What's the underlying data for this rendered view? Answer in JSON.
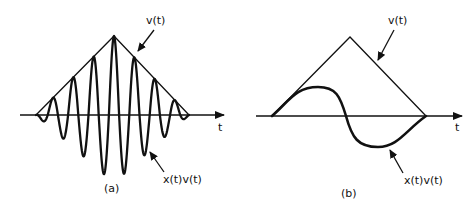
{
  "colors": {
    "ink": "#111111",
    "background": "#ffffff"
  },
  "panels": [
    {
      "id": "a",
      "caption": "(a)",
      "axis_label": "t",
      "envelope_label": "v(t)",
      "product_label": "x(t)v(t)",
      "axis": {
        "y": 115,
        "x_start": 20,
        "x_end": 224
      },
      "envelope": {
        "left": [
          36,
          115
        ],
        "apex": [
          114,
          36
        ],
        "right": [
          189,
          115
        ]
      },
      "product_curve": {
        "description": "high-frequency oscillation modulated by triangular envelope v(t)",
        "peaks": [
          [
            52,
            98
          ],
          [
            69,
            80
          ],
          [
            89,
            61
          ],
          [
            114,
            36
          ],
          [
            136,
            61
          ],
          [
            155,
            80
          ],
          [
            172,
            98
          ]
        ],
        "troughs": [
          [
            44,
            124
          ],
          [
            62,
            143
          ],
          [
            80,
            160
          ],
          [
            101,
            183
          ],
          [
            126,
            183
          ],
          [
            146,
            160
          ],
          [
            163,
            143
          ],
          [
            181,
            124
          ]
        ]
      },
      "label_positions": {
        "envelope_label": [
          146,
          24
        ],
        "envelope_arrow": [
          [
            154,
            30
          ],
          [
            138,
            51
          ]
        ],
        "product_label": [
          163,
          183
        ],
        "product_arrow": [
          [
            164,
            172
          ],
          [
            150,
            152
          ]
        ],
        "axis_label": [
          218,
          131
        ],
        "caption": [
          104,
          192
        ]
      }
    },
    {
      "id": "b",
      "caption": "(b)",
      "axis_label": "t",
      "envelope_label": "v(t)",
      "product_label": "x(t)v(t)",
      "axis": {
        "y": 116,
        "x_start": 256,
        "x_end": 462
      },
      "envelope": {
        "left": [
          272,
          116
        ],
        "apex": [
          350,
          37
        ],
        "right": [
          426,
          116
        ]
      },
      "product_curve": {
        "description": "slowly varying signal multiplied by triangular envelope v(t)",
        "points": [
          [
            272,
            116
          ],
          [
            318,
            87
          ],
          [
            346,
            116
          ],
          [
            378,
            147
          ],
          [
            426,
            116
          ]
        ]
      },
      "label_positions": {
        "envelope_label": [
          388,
          24
        ],
        "envelope_arrow": [
          [
            394,
            30
          ],
          [
            378,
            60
          ]
        ],
        "product_label": [
          404,
          184
        ],
        "product_arrow": [
          [
            403,
            173
          ],
          [
            390,
            150
          ]
        ],
        "axis_label": [
          455,
          131
        ],
        "caption": [
          341,
          197
        ]
      }
    }
  ]
}
